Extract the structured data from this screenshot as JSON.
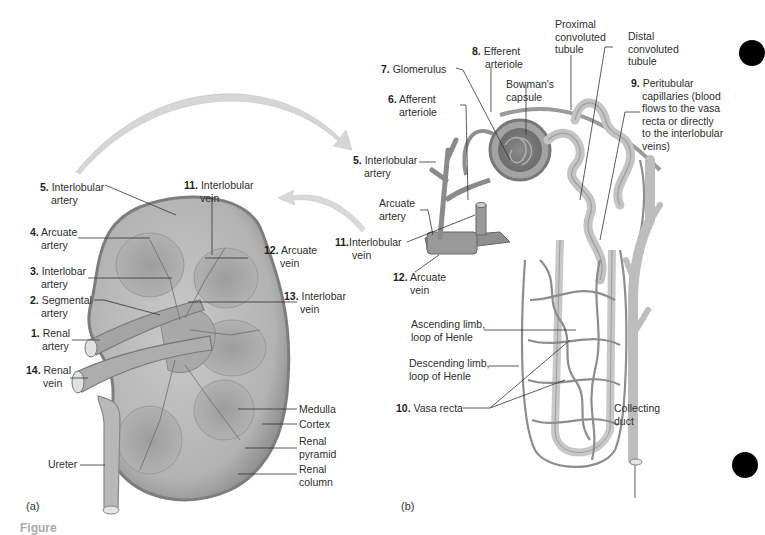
{
  "figure": {
    "panel_a_label": "(a)",
    "panel_b_label": "(b)",
    "caption_partial": "Figure"
  },
  "panel_a": {
    "title": "Kidney (frontal section) — blood supply",
    "labels": [
      {
        "num": "5.",
        "text1": "Interlobular",
        "text2": "artery"
      },
      {
        "num": "4.",
        "text1": "Arcuate",
        "text2": "artery"
      },
      {
        "num": "3.",
        "text1": "Interlobar",
        "text2": "artery"
      },
      {
        "num": "2.",
        "text1": "Segmental",
        "text2": "artery"
      },
      {
        "num": "1.",
        "text1": "Renal",
        "text2": "artery"
      },
      {
        "num": "14.",
        "text1": "Renal",
        "text2": "vein"
      },
      {
        "num": "",
        "text1": "Ureter",
        "text2": ""
      },
      {
        "num": "11.",
        "text1": "Interlobular",
        "text2": "vein"
      },
      {
        "num": "12.",
        "text1": "Arcuate",
        "text2": "vein"
      },
      {
        "num": "13.",
        "text1": "Interlobar",
        "text2": "vein"
      },
      {
        "num": "",
        "text1": "Medulla",
        "text2": ""
      },
      {
        "num": "",
        "text1": "Cortex",
        "text2": ""
      },
      {
        "num": "",
        "text1": "Renal",
        "text2": "pyramid"
      },
      {
        "num": "",
        "text1": "Renal",
        "text2": "column"
      }
    ]
  },
  "panel_b": {
    "title": "Nephron and associated blood vessels",
    "labels": [
      {
        "num": "7.",
        "text1": "Glomerulus",
        "text2": ""
      },
      {
        "num": "8.",
        "text1": "Efferent",
        "text2": "arteriole"
      },
      {
        "num": "6.",
        "text1": "Afferent",
        "text2": "arteriole"
      },
      {
        "num": "",
        "text1": "Bowman's",
        "text2": "capsule"
      },
      {
        "num": "",
        "text1": "Proximal",
        "text2": "convoluted",
        "text3": "tubule"
      },
      {
        "num": "",
        "text1": "Distal",
        "text2": "convoluted",
        "text3": "tubule"
      },
      {
        "num": "9.",
        "text1": "Peritubular",
        "text2": "capillaries (blood",
        "text3": "flows to the vasa",
        "text4": "recta or directly",
        "text5": "to the interlobular",
        "text6": "veins)"
      },
      {
        "num": "5.",
        "text1": "Interlobular",
        "text2": "artery"
      },
      {
        "num": "",
        "text1": "Arcuate",
        "text2": "artery"
      },
      {
        "num": "11.",
        "text1": "Interlobular",
        "text2": "vein"
      },
      {
        "num": "12.",
        "text1": "Arcuate",
        "text2": "vein"
      },
      {
        "num": "",
        "text1": "Ascending limb,",
        "text2": "loop of Henle"
      },
      {
        "num": "",
        "text1": "Descending limb,",
        "text2": "loop of Henle"
      },
      {
        "num": "10.",
        "text1": "Vasa recta",
        "text2": ""
      },
      {
        "num": "",
        "text1": "Collecting",
        "text2": "duct"
      }
    ]
  },
  "colors": {
    "tissue": "#b9b9b9",
    "tissue_dark": "#8a8a8a",
    "vessel": "#9c9c9c",
    "tubule": "#c8c8c8",
    "arrow": "#d4d4d4",
    "leader": "#333333",
    "margin_dot": "#000000"
  }
}
